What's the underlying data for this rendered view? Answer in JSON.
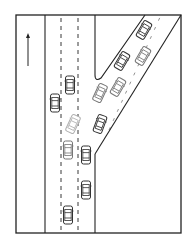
{
  "diagram": {
    "type": "road-merge-illustration",
    "frame": {
      "x": 16,
      "y": 15,
      "width": 165,
      "height": 218
    },
    "colors": {
      "line": "#222222",
      "car_dark": "#333333",
      "car_light": "#777777",
      "car_ghost": "#b0b0b0",
      "background": "#ffffff"
    },
    "direction_arrow": {
      "x": 28,
      "y_top": 33,
      "y_bottom": 66,
      "points": "up"
    },
    "main_road": {
      "left_edge_x": 45,
      "lane_dividers_x": [
        61,
        78
      ],
      "right_edge_x": 95,
      "lanes": 2
    },
    "ramp": {
      "inner_curb": "vertical at x=95 from top to y=78, curving into diagonal to (145,15)",
      "outer_edge": "diagonal from (95,154) to (181,15)"
    },
    "cars": [
      {
        "id": "main-1",
        "x": 70,
        "y": 85,
        "angle": 0,
        "style": "dark"
      },
      {
        "id": "main-2",
        "x": 55,
        "y": 103,
        "angle": 0,
        "style": "dark"
      },
      {
        "id": "merging-ghost",
        "x": 73,
        "y": 124,
        "angle": 25,
        "style": "ghost"
      },
      {
        "id": "main-3",
        "x": 68,
        "y": 150,
        "angle": 0,
        "style": "light"
      },
      {
        "id": "main-4",
        "x": 86,
        "y": 155,
        "angle": 0,
        "style": "dark"
      },
      {
        "id": "main-5",
        "x": 86,
        "y": 190,
        "angle": 0,
        "style": "dark"
      },
      {
        "id": "main-6",
        "x": 68,
        "y": 215,
        "angle": 0,
        "style": "dark"
      },
      {
        "id": "ramp-1",
        "x": 144,
        "y": 30,
        "angle": 30,
        "style": "dark"
      },
      {
        "id": "ramp-2",
        "x": 122,
        "y": 61,
        "angle": 30,
        "style": "dark"
      },
      {
        "id": "ramp-3",
        "x": 143,
        "y": 56,
        "angle": 30,
        "style": "light"
      },
      {
        "id": "ramp-4",
        "x": 118,
        "y": 87,
        "angle": 30,
        "style": "light"
      },
      {
        "id": "ramp-5",
        "x": 100,
        "y": 93,
        "angle": 25,
        "style": "light"
      },
      {
        "id": "ramp-6",
        "x": 100,
        "y": 124,
        "angle": 20,
        "style": "dark"
      }
    ]
  }
}
